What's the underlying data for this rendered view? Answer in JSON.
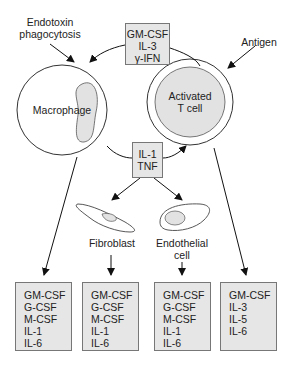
{
  "inputs": {
    "macrophage_stimulus": [
      "Endotoxin",
      "phagocytosis"
    ],
    "tcell_stimulus": "Antigen"
  },
  "center_top_box": [
    "GM-CSF",
    "IL-3",
    "γ-IFN"
  ],
  "center_mid_box": [
    "IL-1",
    "TNF"
  ],
  "cells": {
    "macrophage": "Macrophage",
    "tcell": [
      "Activated",
      "T cell"
    ],
    "fibroblast": "Fibroblast",
    "endothelial": [
      "Endothelial",
      "cell"
    ]
  },
  "outputs": [
    {
      "source": "Macrophage",
      "items": [
        "GM-CSF",
        "G-CSF",
        "M-CSF",
        "IL-1",
        "IL-6"
      ]
    },
    {
      "source": "Fibroblast",
      "items": [
        "GM-CSF",
        "G-CSF",
        "M-CSF",
        "IL-1",
        "IL-6"
      ]
    },
    {
      "source": "Endothelial cell",
      "items": [
        "GM-CSF",
        "G-CSF",
        "M-CSF",
        "IL-1",
        "IL-6"
      ]
    },
    {
      "source": "Activated T cell",
      "items": [
        "GM-CSF",
        "IL-3",
        "IL-5",
        "IL-6"
      ]
    }
  ],
  "colors": {
    "box_fill": "#e6e6e6",
    "nucleus_fill": "#e2e2e2",
    "stroke": "#333333"
  }
}
